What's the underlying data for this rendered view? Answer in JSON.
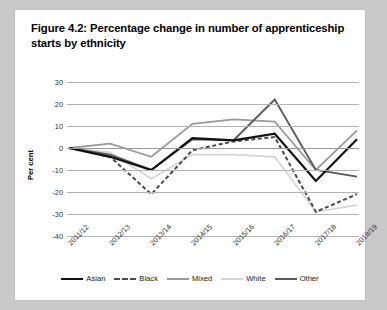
{
  "figure": {
    "title": "Figure 4.2: Percentage change in number of apprenticeship starts by ethnicity"
  },
  "chart_data": {
    "type": "line",
    "title": "Figure 4.2: Percentage change in number of apprenticeship starts by ethnicity",
    "xlabel": "",
    "ylabel": "Per cent",
    "ylim": [
      -40,
      30
    ],
    "ytick_step": 10,
    "yticks": [
      30,
      20,
      10,
      0,
      -10,
      -20,
      -30,
      -40
    ],
    "ytick_labels": [
      "30",
      "20",
      "10",
      "0",
      "-10",
      "-20",
      "-30",
      "-40"
    ],
    "grid": true,
    "legend_position": "bottom",
    "categories": [
      "2011/12",
      "2012/13",
      "2013/14",
      "2014/15",
      "2015/16",
      "2016/17",
      "2017/18",
      "2018/19"
    ],
    "series": [
      {
        "name": "Asian",
        "color": "#111111",
        "style": "solid",
        "width": 2.2,
        "values": [
          0,
          -4,
          -10,
          4.5,
          3.5,
          6.5,
          -15,
          4
        ]
      },
      {
        "name": "Black",
        "color": "#4a4a4a",
        "style": "dashed",
        "width": 2,
        "values": [
          0,
          -4,
          -21,
          -1,
          3,
          5,
          -29,
          -21
        ]
      },
      {
        "name": "Mixed",
        "color": "#9b9b9b",
        "style": "solid",
        "width": 1.8,
        "values": [
          0,
          2,
          -4,
          11,
          13,
          12,
          -10,
          8
        ]
      },
      {
        "name": "White",
        "color": "#d6d6d6",
        "style": "solid",
        "width": 1.8,
        "values": [
          0,
          -2,
          -14,
          -3,
          -3,
          -4,
          -29,
          -26
        ]
      },
      {
        "name": "Other",
        "color": "#5a5a5a",
        "style": "solid",
        "width": 1.9,
        "values": [
          0,
          -3,
          -10,
          4,
          3.5,
          22,
          -10,
          -13
        ]
      }
    ]
  }
}
